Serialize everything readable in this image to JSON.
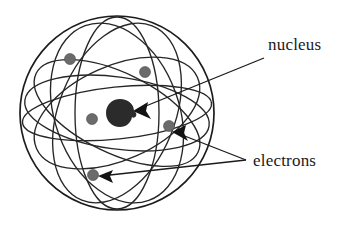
{
  "figure": {
    "type": "atomic-model-diagram",
    "title": "",
    "background_color": "#ffffff",
    "ink_color": "#1a1a1a"
  },
  "labels": {
    "nucleus": {
      "text": "nucleus",
      "x": 268,
      "y": 50,
      "font_size": 17,
      "color": "#1a1a1a"
    },
    "electrons": {
      "text": "electrons",
      "x": 253,
      "y": 166,
      "font_size": 17,
      "color": "#1a1a1a"
    }
  },
  "sphere": {
    "center_x": 117,
    "center_y": 113,
    "radius": 97,
    "stroke_color": "#1c1c1c",
    "stroke_width": 1.7
  },
  "nucleus_particle": {
    "center_x": 120,
    "center_y": 113,
    "radius": 13,
    "color": "#2b2b2b"
  },
  "electrons": [
    {
      "id": "electron-1",
      "x": 70,
      "y": 59,
      "r": 5.5,
      "color": "#6b6b6b"
    },
    {
      "id": "electron-2",
      "x": 145,
      "y": 72,
      "r": 5.5,
      "color": "#6b6b6b"
    },
    {
      "id": "electron-3",
      "x": 92,
      "y": 119,
      "r": 5.5,
      "color": "#6b6b6b"
    },
    {
      "id": "electron-4",
      "x": 169,
      "y": 126,
      "r": 5.5,
      "color": "#6b6b6b"
    },
    {
      "id": "electron-5",
      "x": 93,
      "y": 175,
      "r": 5.5,
      "color": "#6b6b6b"
    }
  ],
  "orbits": [
    {
      "id": "orbit-1",
      "cx": 117,
      "cy": 113,
      "rx": 42,
      "ry": 96,
      "rotate": 0
    },
    {
      "id": "orbit-2",
      "cx": 117,
      "cy": 113,
      "rx": 93,
      "ry": 36,
      "rotate": 8
    },
    {
      "id": "orbit-3",
      "cx": 117,
      "cy": 113,
      "rx": 88,
      "ry": 47,
      "rotate": -24
    },
    {
      "id": "orbit-4",
      "cx": 117,
      "cy": 113,
      "rx": 90,
      "ry": 40,
      "rotate": 26
    },
    {
      "id": "orbit-5",
      "cx": 117,
      "cy": 113,
      "rx": 58,
      "ry": 94,
      "rotate": 22
    },
    {
      "id": "orbit-6",
      "cx": 117,
      "cy": 113,
      "rx": 62,
      "ry": 93,
      "rotate": -20
    },
    {
      "id": "orbit-7",
      "cx": 117,
      "cy": 113,
      "rx": 95,
      "ry": 26,
      "rotate": -6
    }
  ],
  "leaders": [
    {
      "id": "nucleus-leader",
      "x1": 264,
      "y1": 58,
      "x2": 136,
      "y2": 110
    },
    {
      "id": "electrons-leader-upper",
      "x1": 246,
      "y1": 160,
      "x2": 177,
      "y2": 133
    },
    {
      "id": "electrons-leader-lower",
      "x1": 246,
      "y1": 160,
      "x2": 100,
      "y2": 176
    }
  ],
  "arrowheads": [
    {
      "id": "arrow-to-nucleus",
      "x": 134,
      "y": 110,
      "angle": 202
    },
    {
      "id": "arrow-to-electron-right",
      "x": 174,
      "y": 131,
      "angle": 200
    },
    {
      "id": "arrow-to-electron-lower-left",
      "x": 99,
      "y": 176,
      "angle": 186
    }
  ]
}
